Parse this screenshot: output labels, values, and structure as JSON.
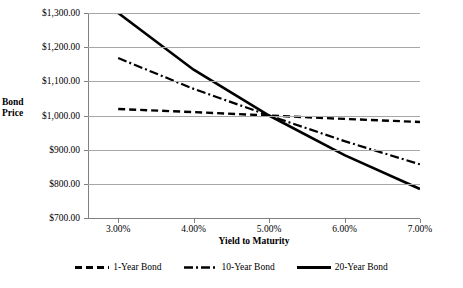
{
  "chart_data": {
    "type": "line",
    "title": "",
    "xlabel": "Yield to Maturity",
    "ylabel": "Bond Price",
    "x": [
      3.0,
      4.0,
      5.0,
      6.0,
      7.0
    ],
    "xtick_labels": [
      "3.00%",
      "4.00%",
      "5.00%",
      "6.00%",
      "7.00%"
    ],
    "ytick_labels": [
      "$1,300.00",
      "$1,200.00",
      "$1,100.00",
      "$1,000.00",
      "$900.00",
      "$800.00",
      "$700.00"
    ],
    "ytick_values": [
      1300,
      1200,
      1100,
      1000,
      900,
      800,
      700
    ],
    "ylim": [
      700,
      1300
    ],
    "xlim": [
      2.6,
      7.0
    ],
    "grid": true,
    "legend_position": "bottom",
    "series": [
      {
        "name": "1-Year Bond",
        "style": "dashed",
        "color": "#000000",
        "values": [
          1019,
          1010,
          1000,
          990,
          981
        ]
      },
      {
        "name": "10-Year Bond",
        "style": "dash-dot",
        "color": "#000000",
        "values": [
          1168,
          1078,
          1000,
          925,
          857
        ]
      },
      {
        "name": "20-Year Bond",
        "style": "solid",
        "color": "#000000",
        "values": [
          1300,
          1134,
          1000,
          884,
          785
        ]
      }
    ]
  },
  "legend": {
    "items": [
      {
        "label": "1-Year Bond",
        "swatch": "dashed-line-swatch"
      },
      {
        "label": "10-Year Bond",
        "swatch": "dash-dot-line-swatch"
      },
      {
        "label": "20-Year Bond",
        "swatch": "solid-line-swatch"
      }
    ]
  }
}
